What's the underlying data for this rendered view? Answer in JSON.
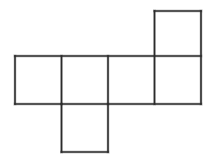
{
  "figure": {
    "name": "cube-net-hexomino",
    "description": "Line drawing of a six-square net (unfolded cube) composed of a horizontal row of four squares, one square above the rightmost square, and one square below the second square from the left.",
    "background_color": "#ffffff",
    "line_color": "#2b2b2b",
    "line_width": 1.6,
    "canvas": {
      "width": 216,
      "height": 167
    },
    "geometry": {
      "cell_size": 46.5,
      "row_top_y": 56,
      "row_bottom_y": 104,
      "row_left_x": 15,
      "row_right_x": 201,
      "column_x": [
        15,
        61.5,
        108,
        154.5,
        201
      ],
      "top_square": {
        "x": 154.5,
        "y": 11,
        "width": 46.5,
        "height": 45
      },
      "bottom_square": {
        "x": 61.5,
        "y": 104,
        "width": 46.5,
        "height": 48
      }
    },
    "squares": [
      {
        "label": "row-square-1",
        "x": 15,
        "y": 56,
        "width": 46.5,
        "height": 48
      },
      {
        "label": "row-square-2",
        "x": 61.5,
        "y": 56,
        "width": 46.5,
        "height": 48
      },
      {
        "label": "row-square-3",
        "x": 108,
        "y": 56,
        "width": 46.5,
        "height": 48
      },
      {
        "label": "row-square-4",
        "x": 154.5,
        "y": 56,
        "width": 46.5,
        "height": 48
      },
      {
        "label": "top-square",
        "x": 154.5,
        "y": 11,
        "width": 46.5,
        "height": 45
      },
      {
        "label": "bottom-square",
        "x": 61.5,
        "y": 104,
        "width": 46.5,
        "height": 48
      }
    ],
    "segments": [
      {
        "name": "row-top-edge",
        "x1": 15,
        "y1": 56,
        "x2": 201,
        "y2": 56
      },
      {
        "name": "row-bottom-edge",
        "x1": 15,
        "y1": 104,
        "x2": 201,
        "y2": 104
      },
      {
        "name": "row-left-edge",
        "x1": 15,
        "y1": 56,
        "x2": 15,
        "y2": 104
      },
      {
        "name": "divider-1",
        "x1": 61.5,
        "y1": 56,
        "x2": 61.5,
        "y2": 104
      },
      {
        "name": "divider-2",
        "x1": 108,
        "y1": 56,
        "x2": 108,
        "y2": 104
      },
      {
        "name": "divider-3",
        "x1": 154.5,
        "y1": 11,
        "x2": 154.5,
        "y2": 104
      },
      {
        "name": "row-right-edge",
        "x1": 201,
        "y1": 11,
        "x2": 201,
        "y2": 104
      },
      {
        "name": "top-square-top-edge",
        "x1": 154.5,
        "y1": 11,
        "x2": 201,
        "y2": 11
      },
      {
        "name": "bottom-square-left",
        "x1": 61.5,
        "y1": 104,
        "x2": 61.5,
        "y2": 152
      },
      {
        "name": "bottom-square-right",
        "x1": 108,
        "y1": 104,
        "x2": 108,
        "y2": 152
      },
      {
        "name": "bottom-square-bottom",
        "x1": 61.5,
        "y1": 152,
        "x2": 108,
        "y2": 152
      }
    ]
  }
}
